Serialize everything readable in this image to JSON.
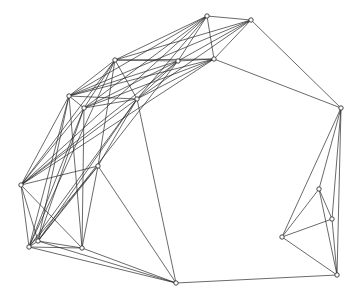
{
  "diagram": {
    "type": "network-graph",
    "background": "#ffffff",
    "edge_color": "#222222",
    "node_stroke": "#333333",
    "node_fill": "#ffffff",
    "nodes": [
      {
        "id": 0,
        "x": 207,
        "y": 16
      },
      {
        "id": 1,
        "x": 251,
        "y": 20
      },
      {
        "id": 2,
        "x": 214,
        "y": 59
      },
      {
        "id": 3,
        "x": 341,
        "y": 108
      },
      {
        "id": 4,
        "x": 115,
        "y": 60
      },
      {
        "id": 5,
        "x": 69,
        "y": 96
      },
      {
        "id": 6,
        "x": 137,
        "y": 99
      },
      {
        "id": 7,
        "x": 84,
        "y": 108
      },
      {
        "id": 8,
        "x": 178,
        "y": 61
      },
      {
        "id": 9,
        "x": 21,
        "y": 185
      },
      {
        "id": 10,
        "x": 98,
        "y": 166
      },
      {
        "id": 11,
        "x": 38,
        "y": 241
      },
      {
        "id": 12,
        "x": 29,
        "y": 247
      },
      {
        "id": 13,
        "x": 82,
        "y": 248
      },
      {
        "id": 14,
        "x": 176,
        "y": 283
      },
      {
        "id": 15,
        "x": 319,
        "y": 189
      },
      {
        "id": 16,
        "x": 332,
        "y": 219
      },
      {
        "id": 17,
        "x": 282,
        "y": 237
      },
      {
        "id": 18,
        "x": 337,
        "y": 275
      }
    ],
    "edges": [
      [
        0,
        1
      ],
      [
        0,
        2
      ],
      [
        0,
        4
      ],
      [
        0,
        5
      ],
      [
        0,
        6
      ],
      [
        0,
        7
      ],
      [
        0,
        8
      ],
      [
        0,
        9
      ],
      [
        1,
        2
      ],
      [
        1,
        3
      ],
      [
        1,
        4
      ],
      [
        1,
        5
      ],
      [
        1,
        6
      ],
      [
        1,
        8
      ],
      [
        2,
        3
      ],
      [
        2,
        4
      ],
      [
        2,
        5
      ],
      [
        2,
        6
      ],
      [
        2,
        7
      ],
      [
        2,
        8
      ],
      [
        2,
        9
      ],
      [
        3,
        15
      ],
      [
        3,
        16
      ],
      [
        3,
        17
      ],
      [
        3,
        18
      ],
      [
        4,
        5
      ],
      [
        4,
        6
      ],
      [
        4,
        7
      ],
      [
        4,
        8
      ],
      [
        4,
        9
      ],
      [
        4,
        10
      ],
      [
        4,
        12
      ],
      [
        5,
        6
      ],
      [
        5,
        7
      ],
      [
        5,
        9
      ],
      [
        5,
        11
      ],
      [
        5,
        12
      ],
      [
        5,
        13
      ],
      [
        5,
        8
      ],
      [
        6,
        7
      ],
      [
        6,
        9
      ],
      [
        6,
        10
      ],
      [
        6,
        11
      ],
      [
        6,
        12
      ],
      [
        6,
        14
      ],
      [
        6,
        8
      ],
      [
        7,
        9
      ],
      [
        7,
        11
      ],
      [
        7,
        12
      ],
      [
        7,
        13
      ],
      [
        7,
        8
      ],
      [
        8,
        9
      ],
      [
        8,
        11
      ],
      [
        9,
        10
      ],
      [
        9,
        11
      ],
      [
        9,
        12
      ],
      [
        9,
        13
      ],
      [
        10,
        11
      ],
      [
        10,
        12
      ],
      [
        10,
        13
      ],
      [
        10,
        14
      ],
      [
        11,
        12
      ],
      [
        11,
        13
      ],
      [
        11,
        14
      ],
      [
        12,
        13
      ],
      [
        12,
        14
      ],
      [
        13,
        14
      ],
      [
        14,
        18
      ],
      [
        15,
        16
      ],
      [
        15,
        17
      ],
      [
        15,
        18
      ],
      [
        16,
        17
      ],
      [
        16,
        18
      ],
      [
        17,
        18
      ]
    ]
  }
}
